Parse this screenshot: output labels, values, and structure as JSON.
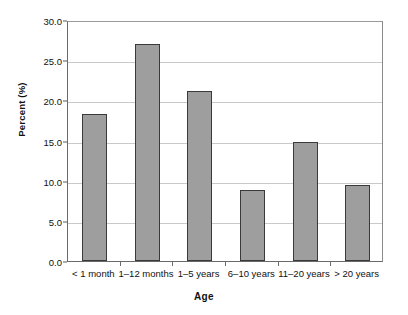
{
  "chart_data": {
    "type": "bar",
    "title": "",
    "xlabel": "Age",
    "ylabel": "Percent (%)",
    "categories": [
      "< 1 month",
      "1–12 months",
      "1–5 years",
      "6–10 years",
      "11–20 years",
      "> 20 years"
    ],
    "values": [
      18.3,
      27.0,
      21.2,
      8.9,
      14.8,
      9.5
    ],
    "ylim": [
      0.0,
      30.0
    ],
    "ytick_values": [
      0.0,
      5.0,
      10.0,
      15.0,
      20.0,
      25.0,
      30.0
    ],
    "ytick_labels": [
      "0.0",
      "5.0",
      "10.0",
      "15.0",
      "20.0",
      "25.0",
      "30.0"
    ],
    "grid": "horizontal",
    "legend": "none",
    "bar_color": "#9e9e9e",
    "bar_border_color": "#3a3a3a",
    "gridline_color": "#c9c9c9",
    "axis_color": "#6a6a6a",
    "background_color": "#ffffff"
  }
}
